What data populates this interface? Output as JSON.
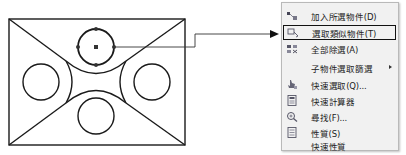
{
  "drawing": {
    "description": "CAD sketch: rectangle with diagonals, four circles, two tangent arcs; top circle selected with grips",
    "selected_entity": "top-circle"
  },
  "context_menu": {
    "items": [
      {
        "icon": "add-to-group-icon",
        "label": "加入所選物件(D)",
        "highlighted": false
      },
      {
        "icon": "select-similar-icon",
        "label": "選取類似物件(T)",
        "highlighted": true
      },
      {
        "icon": "deselect-all-icon",
        "label": "全部除選(A)",
        "highlighted": false
      },
      {
        "icon": "",
        "label": "子物件選取篩選",
        "highlighted": false,
        "submenu": true
      },
      {
        "icon": "quick-select-icon",
        "label": "快速選取(Q)...",
        "highlighted": false
      },
      {
        "icon": "quick-calc-icon",
        "label": "快速計算器",
        "highlighted": false
      },
      {
        "icon": "find-icon",
        "label": "尋找(F)...",
        "highlighted": false
      },
      {
        "icon": "properties-icon",
        "label": "性質(S)",
        "highlighted": false
      },
      {
        "icon": "",
        "label": "快速性質",
        "highlighted": false
      }
    ]
  },
  "colors": {
    "line": "#1a1a1a",
    "menu_bg": "#f1f1f1",
    "menu_border": "#b9b9b9",
    "highlight_border": "#111111"
  }
}
